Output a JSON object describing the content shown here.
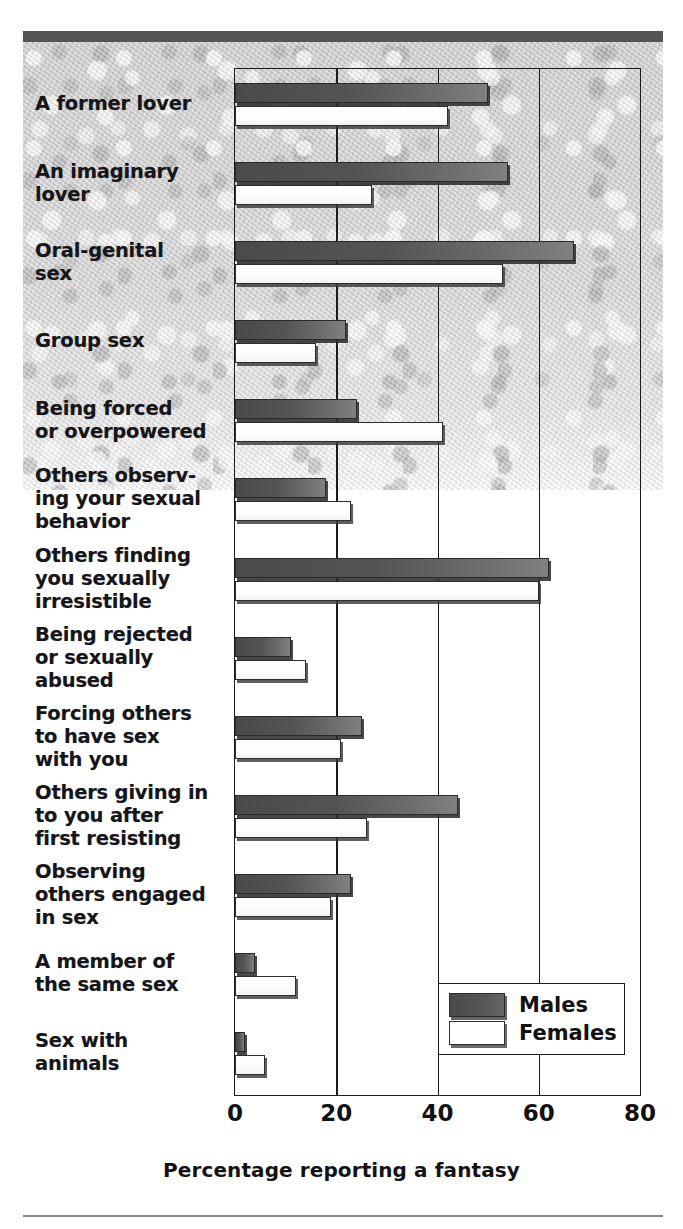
{
  "chart_data": {
    "type": "bar",
    "orientation": "horizontal",
    "title": "",
    "xlabel": "Percentage reporting a fantasy",
    "ylabel": "",
    "xlim": [
      0,
      80
    ],
    "xticks": [
      0,
      20,
      40,
      60,
      80
    ],
    "xtick_labels": [
      "0",
      "20",
      "40",
      "60",
      "80"
    ],
    "grid": "vertical gridlines at 20, 40, 60",
    "legend_position": "lower right, inside plot area",
    "categories": [
      "A former lover",
      "An imaginary\nlover",
      "Oral-genital\nsex",
      "Group sex",
      "Being forced\nor overpowered",
      "Others observ-\ning your sexual\nbehavior",
      "Others finding\nyou sexually\nirresistible",
      "Being rejected\nor sexually\nabused",
      "Forcing others\nto have sex\nwith you",
      "Others giving in\nto you after\nfirst resisting",
      "Observing\nothers engaged\nin sex",
      "A member of\nthe same sex",
      "Sex with\nanimals"
    ],
    "series": [
      {
        "name": "Males",
        "color": "#555555",
        "values": [
          50,
          54,
          67,
          22,
          24,
          18,
          62,
          11,
          25,
          44,
          23,
          4,
          2
        ]
      },
      {
        "name": "Females",
        "color": "#ffffff",
        "values": [
          42,
          27,
          53,
          16,
          41,
          23,
          60,
          14,
          21,
          26,
          19,
          12,
          6
        ]
      }
    ]
  },
  "legend": {
    "entries": [
      {
        "label": "Males",
        "swatch": "male"
      },
      {
        "label": "Females",
        "swatch": "female"
      }
    ]
  },
  "axis": {
    "x_title": "Percentage reporting a fantasy"
  }
}
